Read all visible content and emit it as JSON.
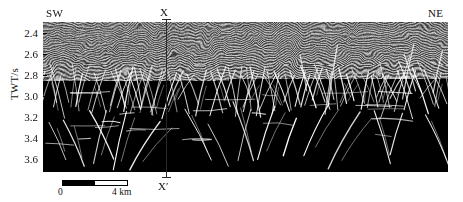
{
  "figure": {
    "type": "seismic-section",
    "direction_left": "SW",
    "direction_right": "NE",
    "section_line_top": "X",
    "section_line_bottom": "X′"
  },
  "axis": {
    "ylabel": "TWT/s",
    "yticks": [
      "2.4",
      "2.6",
      "2.8",
      "3.0",
      "3.2",
      "3.4",
      "3.6"
    ],
    "ylim": [
      2.3,
      3.72
    ],
    "ytick_step": 0.2
  },
  "scalebar": {
    "left_label": "0",
    "right_label": "4 km",
    "length_km": 4
  },
  "colors": {
    "background": "#ffffff",
    "panel_mid_gray": "#8a8a8a",
    "reflector_dark": "#1a1a1a",
    "reflector_light": "#f2f2f2",
    "fault_trace": "#ffffff",
    "axis_line": "#000000",
    "section_line": "#2a2a2a"
  },
  "chart_data": {
    "type": "heatmap",
    "title": "",
    "xlabel": "",
    "ylabel": "TWT/s",
    "ylim": [
      2.3,
      3.72
    ],
    "xlim": [
      0,
      24.5
    ],
    "grid": false,
    "legend": null,
    "annotations": [
      {
        "text": "SW",
        "x": 0.4,
        "y": 2.28,
        "role": "direction-label"
      },
      {
        "text": "NE",
        "x": 23.8,
        "y": 2.28,
        "role": "direction-label"
      },
      {
        "text": "X",
        "x": 7.45,
        "y": 2.26,
        "role": "section-line-top"
      },
      {
        "text": "X′",
        "x": 7.45,
        "y": 3.78,
        "role": "section-line-bottom"
      }
    ],
    "intervals": [
      {
        "name": "upper conformable unit",
        "twt_top": 2.3,
        "twt_base": 2.7,
        "character": "continuous parallel low-amplitude reflectors"
      },
      {
        "name": "polygonal fault tier",
        "twt_top": 2.7,
        "twt_base": 3.2,
        "character": "dense small-offset normal faults, layer-bound"
      },
      {
        "name": "lower faulted unit",
        "twt_top": 3.2,
        "twt_base": 3.72,
        "character": "high-amplitude reflectors offset by large normal faults"
      }
    ]
  }
}
